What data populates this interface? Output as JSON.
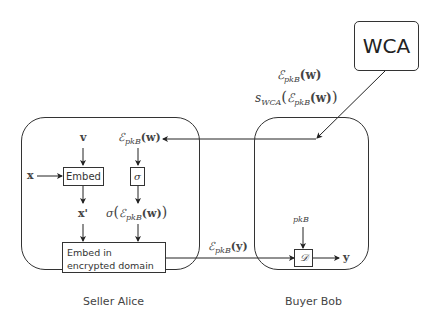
{
  "diagram": {
    "wca": {
      "label": "WCA"
    },
    "seller": {
      "label": "Seller Alice"
    },
    "buyer": {
      "label": "Buyer Bob"
    },
    "wca_message": {
      "line1": {
        "symbol": "ℰ",
        "sub": "pkB",
        "arg": "(w)"
      },
      "line2": {
        "prefix": "s",
        "prefix_sub": "WCA",
        "symbol": "ℰ",
        "sub": "pkB",
        "arg": "(w)"
      }
    },
    "seller_nodes": {
      "v": "v",
      "x": "x",
      "x_prime": "x'",
      "enc_w": {
        "symbol": "ℰ",
        "sub": "pkB",
        "arg": "(w)"
      },
      "embed": "Embed",
      "sigma_box": "σ",
      "sigma_out": {
        "prefix": "σ",
        "symbol": "ℰ",
        "sub": "pkB",
        "arg": "(w)"
      },
      "embed_encrypted": "Embed in encrypted domain"
    },
    "transfer_label": {
      "symbol": "ℰ",
      "sub": "pkB",
      "arg": "(y)"
    },
    "buyer_nodes": {
      "pkB": "pkB",
      "decrypt_box": "𝒟",
      "y": "y"
    }
  }
}
